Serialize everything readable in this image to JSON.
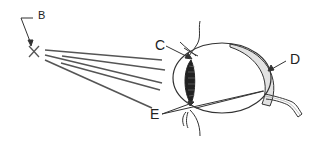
{
  "diagram": {
    "labels": {
      "b": "B",
      "c": "C",
      "d": "D",
      "e": "E"
    },
    "colors": {
      "line": "#444444",
      "ray": "#555555",
      "shade": "#dddddd",
      "lens": "#222222"
    }
  }
}
